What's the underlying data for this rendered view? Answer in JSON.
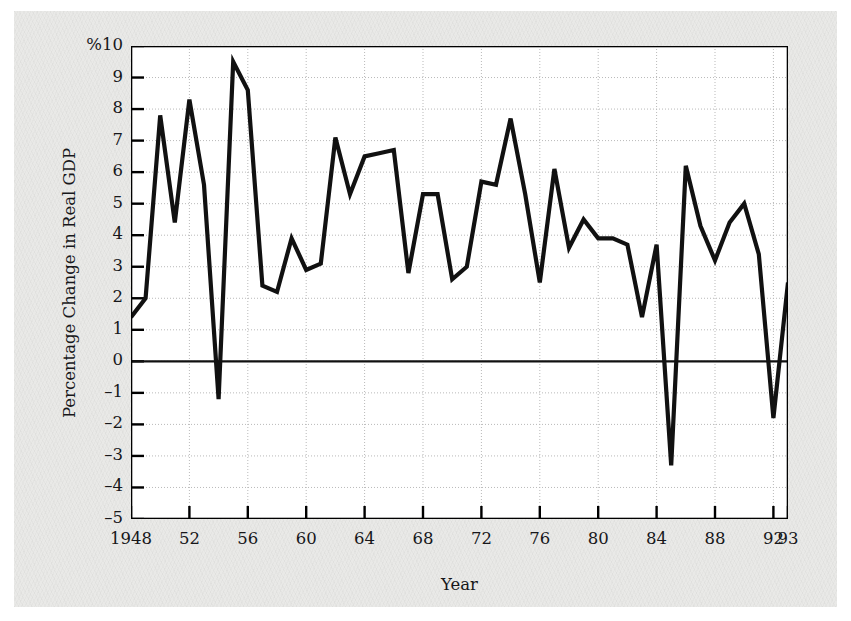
{
  "figure": {
    "background_color": "#e9e9e7",
    "plot_background_color": "#ffffff",
    "line_color": "#111111",
    "axis_color": "#000000",
    "grid_color": "#b9b9b9",
    "percent_prefix": "%"
  },
  "chart_data": {
    "type": "line",
    "title": "",
    "xlabel": "Year",
    "ylabel": "Percentage Change in Real GDP",
    "xlim": [
      1948,
      1993
    ],
    "ylim": [
      -5,
      10
    ],
    "grid": true,
    "legend": "none",
    "y_ticks": [
      10,
      9,
      8,
      7,
      6,
      5,
      4,
      3,
      2,
      1,
      0,
      -1,
      -2,
      -3,
      -4,
      -5
    ],
    "y_tick_labels": [
      "%10",
      "9",
      "8",
      "7",
      "6",
      "5",
      "4",
      "3",
      "2",
      "1",
      "0",
      "–1",
      "–2",
      "–3",
      "–4",
      "–5"
    ],
    "x_ticks": [
      1948,
      1952,
      1956,
      1960,
      1964,
      1968,
      1972,
      1976,
      1980,
      1984,
      1988,
      1992,
      1993
    ],
    "x_tick_labels": [
      "1948",
      "52",
      "56",
      "60",
      "64",
      "68",
      "72",
      "76",
      "80",
      "84",
      "88",
      "92",
      "93"
    ],
    "series": [
      {
        "name": "Percentage Change in Real GDP",
        "x": [
          1948,
          1949,
          1950,
          1951,
          1952,
          1953,
          1954,
          1955,
          1956,
          1957,
          1958,
          1959,
          1960,
          1961,
          1962,
          1963,
          1964,
          1965,
          1966,
          1967,
          1968,
          1969,
          1970,
          1971,
          1972,
          1973,
          1974,
          1975,
          1976,
          1977,
          1978,
          1979,
          1980,
          1981,
          1982,
          1983,
          1984,
          1985,
          1986,
          1987,
          1988,
          1989,
          1990,
          1991,
          1992,
          1993
        ],
        "values": [
          1.4,
          2.0,
          7.8,
          4.4,
          8.3,
          5.6,
          -1.2,
          9.5,
          8.6,
          2.4,
          2.2,
          3.9,
          2.9,
          3.1,
          7.1,
          5.3,
          6.5,
          6.6,
          6.7,
          2.8,
          5.3,
          5.3,
          2.6,
          3.0,
          5.7,
          5.6,
          7.7,
          5.3,
          2.5,
          6.1,
          3.6,
          4.5,
          3.9,
          3.9,
          3.7,
          1.4,
          3.7,
          -3.3,
          6.2,
          4.3,
          3.2,
          4.4,
          5.0,
          3.4,
          -1.8,
          2.5
        ]
      }
    ],
    "note": "Annual percentage change in real GDP, 1948-1993"
  },
  "axes": {
    "y_axis_title": "Percentage Change in Real GDP",
    "x_axis_title": "Year"
  }
}
